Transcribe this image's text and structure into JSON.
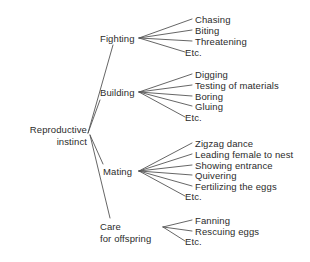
{
  "diagram": {
    "type": "tree",
    "background_color": "#ffffff",
    "text_color": "#2b2b2b",
    "line_color": "#555555",
    "root": {
      "line1": "Reproductive",
      "line2": "instinct"
    },
    "branches": [
      {
        "id": "fighting",
        "label_line1": "Fighting",
        "label_line2": "",
        "leaves": [
          "Chasing",
          "Biting",
          "Threatening"
        ],
        "etc": "Etc."
      },
      {
        "id": "building",
        "label_line1": "Building",
        "label_line2": "",
        "leaves": [
          "Digging",
          "Testing of materials",
          "Boring",
          "Gluing"
        ],
        "etc": "Etc."
      },
      {
        "id": "mating",
        "label_line1": "Mating",
        "label_line2": "",
        "leaves": [
          "Zigzag dance",
          "Leading female to nest",
          "Showing entrance",
          "Quivering",
          "Fertilizing the eggs"
        ],
        "etc": "Etc."
      },
      {
        "id": "care-for-offspring",
        "label_line1": "Care",
        "label_line2": "for offspring",
        "leaves": [
          "Fanning",
          "Rescuing eggs"
        ],
        "etc": "Etc."
      }
    ]
  }
}
